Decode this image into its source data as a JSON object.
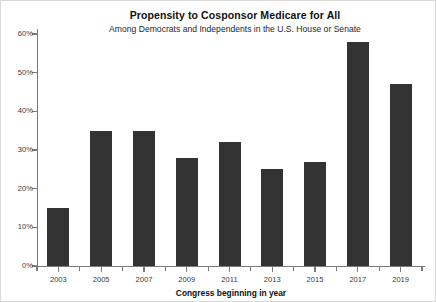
{
  "chart_data": {
    "type": "bar",
    "title": "Propensity to Cosponsor Medicare for All",
    "subtitle": "Among Democrats and Independents in the U.S. House or Senate",
    "xlabel": "Congress beginning in year",
    "ylabel": "",
    "categories": [
      "2003",
      "2005",
      "2007",
      "2009",
      "2011",
      "2013",
      "2015",
      "2017",
      "2019"
    ],
    "values": [
      15,
      35,
      35,
      28,
      32,
      25,
      27,
      58,
      47
    ],
    "value_labels": [
      "15%",
      "35%",
      "35%",
      "28%",
      "32%",
      "25%",
      "27%",
      "58%",
      "47%"
    ],
    "ylim": [
      0,
      60
    ],
    "ytick_values": [
      0,
      10,
      20,
      30,
      40,
      50,
      60
    ],
    "ytick_labels": [
      "0%",
      "10%",
      "20%",
      "30%",
      "40%",
      "50%",
      "60%"
    ],
    "grid": false,
    "legend": null,
    "bar_color": "#333333",
    "axis_color": "#7a7a7a",
    "background_color": "#ffffff",
    "border_color": "#d9d9d9"
  }
}
